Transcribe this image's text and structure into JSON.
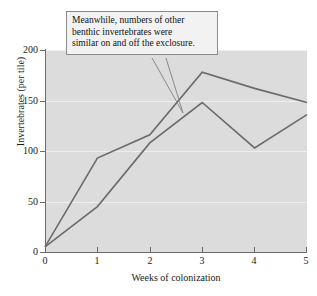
{
  "chart_data": {
    "type": "line",
    "title": "",
    "xlabel": "Weeks of colonization",
    "ylabel": "Invertebrates (per tile)",
    "xlim": [
      0,
      5
    ],
    "ylim": [
      0,
      200
    ],
    "xticks": [
      "0",
      "1",
      "2",
      "3",
      "4",
      "5"
    ],
    "yticks": [
      "0",
      "50",
      "100",
      "150",
      "200"
    ],
    "grid": true,
    "legend": "none",
    "x": [
      0,
      1,
      2,
      3,
      4,
      5
    ],
    "series": [
      {
        "name": "exclosure",
        "values": [
          5,
          93,
          116,
          178,
          162,
          148
        ],
        "color": "#6b6b6b"
      },
      {
        "name": "control",
        "values": [
          5,
          45,
          108,
          148,
          103,
          136
        ],
        "color": "#6b6b6b"
      }
    ],
    "annotations": [
      {
        "text": "Meanwhile, numbers of other benthic invertebrates were similar on and off the exclosure.",
        "line1": "Meanwhile, numbers of other",
        "line2": "benthic invertebrates were",
        "line3": "similar on and off the exclosure."
      }
    ]
  },
  "colors": {
    "plot_background": "#dcdcdc",
    "gridline": "#efefef",
    "axis": "#6b6b6b",
    "line": "#6b6b6b",
    "callout_background": "#f2f2f2",
    "callout_border": "#8a8a8a",
    "text": "#1a1a1a"
  }
}
